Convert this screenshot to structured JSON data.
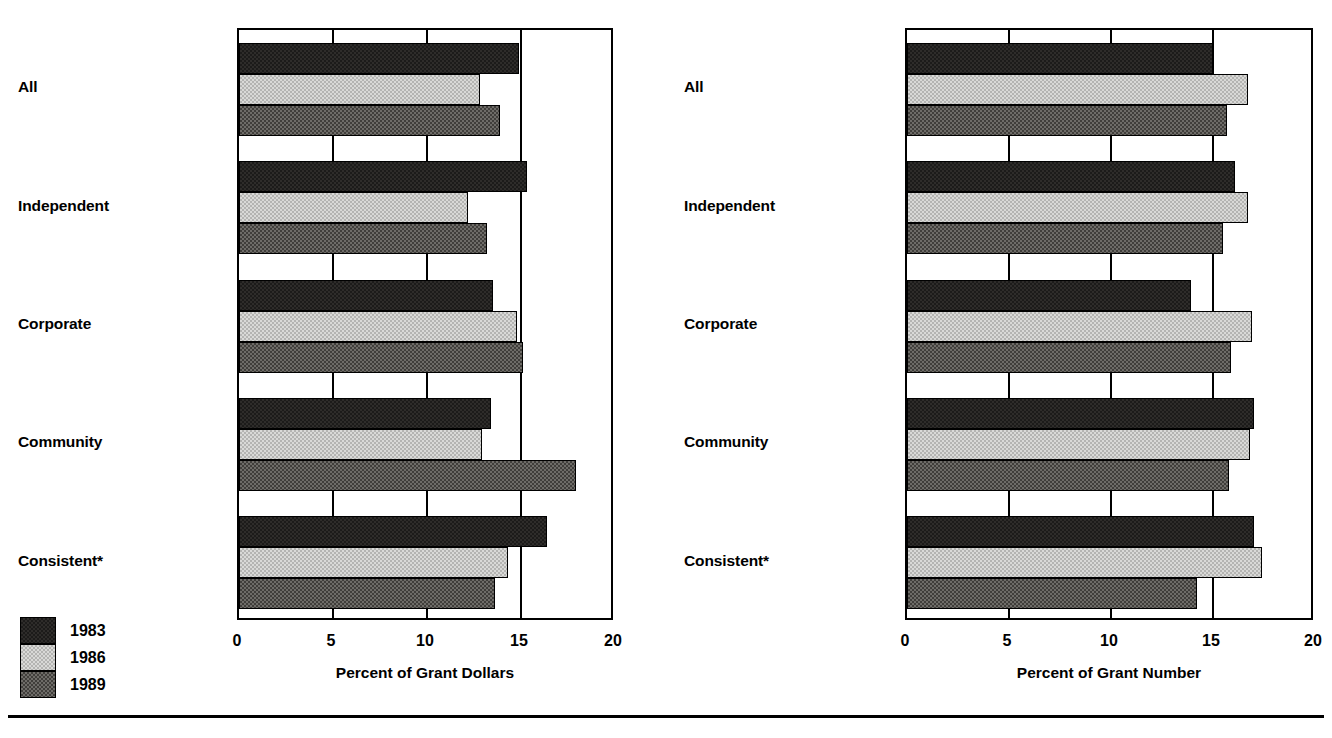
{
  "chart_data": [
    {
      "type": "bar",
      "orientation": "horizontal",
      "title": "",
      "xlabel": "Percent of Grant Dollars",
      "ylabel": "",
      "xlim": [
        0,
        20
      ],
      "xticks": [
        0,
        5,
        10,
        15,
        20
      ],
      "xtick_labels": [
        "0",
        "5",
        "10",
        "15",
        "20"
      ],
      "grid": true,
      "legend_position": "bottom-left",
      "categories": [
        "All",
        "Independent",
        "Corporate",
        "Community",
        "Consistent*"
      ],
      "series": [
        {
          "name": "1983",
          "values": [
            14.9,
            15.3,
            13.5,
            13.4,
            16.4
          ]
        },
        {
          "name": "1986",
          "values": [
            12.8,
            12.2,
            14.8,
            12.9,
            14.3
          ]
        },
        {
          "name": "1989",
          "values": [
            13.9,
            13.2,
            15.1,
            17.9,
            13.6
          ]
        }
      ]
    },
    {
      "type": "bar",
      "orientation": "horizontal",
      "title": "",
      "xlabel": "Percent of Grant Number",
      "ylabel": "",
      "xlim": [
        0,
        20
      ],
      "xticks": [
        0,
        5,
        10,
        15,
        20
      ],
      "xtick_labels": [
        "0",
        "5",
        "10",
        "15",
        "20"
      ],
      "grid": true,
      "legend_position": "bottom-left",
      "categories": [
        "All",
        "Independent",
        "Corporate",
        "Community",
        "Consistent*"
      ],
      "series": [
        {
          "name": "1983",
          "values": [
            15.0,
            16.1,
            13.9,
            17.0,
            17.0
          ]
        },
        {
          "name": "1986",
          "values": [
            16.7,
            16.7,
            16.9,
            16.8,
            17.4
          ]
        },
        {
          "name": "1989",
          "values": [
            15.7,
            15.5,
            15.9,
            15.8,
            14.2
          ]
        }
      ]
    }
  ],
  "legend": {
    "items": [
      {
        "label": "1983",
        "swatch": "black-pattern",
        "color": "#1c1b1a"
      },
      {
        "label": "1986",
        "swatch": "light-gray-pattern",
        "color": "#d9d9d7"
      },
      {
        "label": "1989",
        "swatch": "dark-gray-pattern",
        "color": "#6e6c68"
      }
    ]
  }
}
